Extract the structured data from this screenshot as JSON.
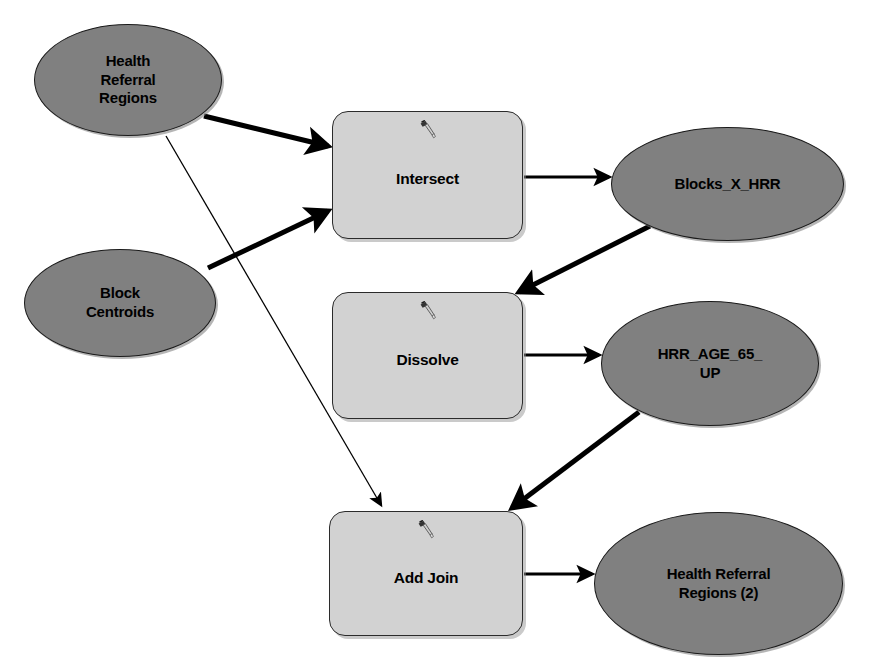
{
  "diagram": {
    "type": "workflow-diagram",
    "canvas": {
      "width": 871,
      "height": 669,
      "background": "#ffffff"
    },
    "palette": {
      "data_fill": "#808080",
      "tool_fill": "#d2d2d2",
      "outline": "#1a1a1a",
      "edge": "#000000",
      "label": "#000000"
    },
    "nodes": [
      {
        "id": "health-referral-regions",
        "label": "Health\nReferral\nRegions",
        "kind": "data",
        "shape": "ellipse",
        "x": 34,
        "y": 24,
        "w": 188,
        "h": 112
      },
      {
        "id": "block-centroids",
        "label": "Block\nCentroids",
        "kind": "data",
        "shape": "ellipse",
        "x": 24,
        "y": 249,
        "w": 192,
        "h": 108
      },
      {
        "id": "intersect",
        "label": "Intersect",
        "kind": "tool",
        "shape": "rounded-rect",
        "icon": "hammer-tool-icon",
        "x": 332,
        "y": 111,
        "w": 191,
        "h": 128
      },
      {
        "id": "blocks-x-hrr",
        "label": "Blocks_X_HRR",
        "kind": "data",
        "shape": "ellipse",
        "x": 611,
        "y": 127,
        "w": 233,
        "h": 114
      },
      {
        "id": "dissolve",
        "label": "Dissolve",
        "kind": "tool",
        "shape": "rounded-rect",
        "icon": "hammer-tool-icon",
        "x": 332,
        "y": 292,
        "w": 191,
        "h": 127
      },
      {
        "id": "hrr-age-65-up",
        "label": "HRR_AGE_65_\nUP",
        "kind": "data",
        "shape": "ellipse",
        "x": 601,
        "y": 301,
        "w": 218,
        "h": 125
      },
      {
        "id": "add-join",
        "label": "Add Join",
        "kind": "tool",
        "shape": "rounded-rect",
        "icon": "hammer-tool-icon",
        "x": 329,
        "y": 511,
        "w": 194,
        "h": 125
      },
      {
        "id": "health-referral-regions-2",
        "label": "Health Referral\nRegions (2)",
        "kind": "data",
        "shape": "ellipse",
        "x": 594,
        "y": 512,
        "w": 249,
        "h": 143
      }
    ],
    "edges": [
      {
        "id": "hrr-to-intersect",
        "from": "health-referral-regions",
        "to": "intersect",
        "weight": "thick",
        "x1": 204,
        "y1": 116,
        "x2": 328,
        "y2": 146
      },
      {
        "id": "blockcentroids-to-intersect",
        "from": "block-centroids",
        "to": "intersect",
        "weight": "thick",
        "x1": 208,
        "y1": 268,
        "x2": 328,
        "y2": 211
      },
      {
        "id": "hrr-to-addjoin",
        "from": "health-referral-regions",
        "to": "add-join",
        "weight": "thin",
        "x1": 166,
        "y1": 136,
        "x2": 381,
        "y2": 505
      },
      {
        "id": "intersect-to-blocks",
        "from": "intersect",
        "to": "blocks-x-hrr",
        "weight": "medium",
        "x1": 524,
        "y1": 177,
        "x2": 609,
        "y2": 177
      },
      {
        "id": "blocks-to-dissolve",
        "from": "blocks-x-hrr",
        "to": "dissolve",
        "weight": "thick",
        "x1": 650,
        "y1": 226,
        "x2": 519,
        "y2": 292
      },
      {
        "id": "dissolve-to-hrrage",
        "from": "dissolve",
        "to": "hrr-age-65-up",
        "weight": "medium",
        "x1": 524,
        "y1": 355,
        "x2": 599,
        "y2": 355
      },
      {
        "id": "hrrage-to-addjoin",
        "from": "hrr-age-65-up",
        "to": "add-join",
        "weight": "thick",
        "x1": 639,
        "y1": 412,
        "x2": 512,
        "y2": 508
      },
      {
        "id": "addjoin-to-hrr2",
        "from": "add-join",
        "to": "health-referral-regions-2",
        "weight": "medium",
        "x1": 524,
        "y1": 574,
        "x2": 592,
        "y2": 574
      }
    ]
  }
}
